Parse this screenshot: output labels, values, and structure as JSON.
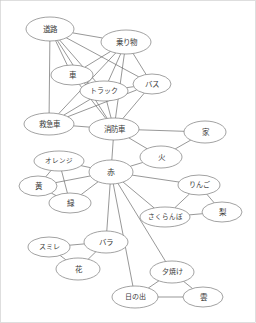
{
  "graph": {
    "title": "",
    "width": 256,
    "height": 323,
    "style": {
      "node_fill": "#ffffff",
      "node_stroke": "#7a7a7a",
      "edge_stroke": "#6b6b6b",
      "label_color": "#3a3a3a",
      "border_color": "#c8c8c8",
      "background": "#ffffff"
    },
    "nodes": [
      {
        "id": "road",
        "label": "道路",
        "x": 50,
        "y": 29,
        "rx": 24,
        "ry": 12,
        "font_size": 7.5
      },
      {
        "id": "vehicle",
        "label": "乗り物",
        "x": 126,
        "y": 42,
        "rx": 25,
        "ry": 12,
        "font_size": 7.5
      },
      {
        "id": "car",
        "label": "車",
        "x": 72,
        "y": 75,
        "rx": 21,
        "ry": 10,
        "font_size": 7.5
      },
      {
        "id": "truck",
        "label": "トラック",
        "x": 104,
        "y": 91,
        "rx": 24,
        "ry": 10,
        "font_size": 7
      },
      {
        "id": "bus",
        "label": "バス",
        "x": 152,
        "y": 84,
        "rx": 19,
        "ry": 10,
        "font_size": 7.5
      },
      {
        "id": "ambulance",
        "label": "救急車",
        "x": 49,
        "y": 124,
        "rx": 25,
        "ry": 11,
        "font_size": 7.5
      },
      {
        "id": "firetruck",
        "label": "消防車",
        "x": 114,
        "y": 129,
        "rx": 25,
        "ry": 11,
        "font_size": 7.5
      },
      {
        "id": "house",
        "label": "家",
        "x": 205,
        "y": 132,
        "rx": 21,
        "ry": 11,
        "font_size": 7.5
      },
      {
        "id": "fire",
        "label": "火",
        "x": 161,
        "y": 157,
        "rx": 21,
        "ry": 11,
        "font_size": 7.5
      },
      {
        "id": "orange",
        "label": "オレンジ",
        "x": 59,
        "y": 161,
        "rx": 25,
        "ry": 10,
        "font_size": 6.5
      },
      {
        "id": "red",
        "label": "赤",
        "x": 111,
        "y": 172,
        "rx": 22,
        "ry": 12,
        "font_size": 8
      },
      {
        "id": "yellow",
        "label": "黄",
        "x": 38,
        "y": 186,
        "rx": 19,
        "ry": 10,
        "font_size": 7.5
      },
      {
        "id": "green",
        "label": "緑",
        "x": 70,
        "y": 203,
        "rx": 21,
        "ry": 10,
        "font_size": 7.5
      },
      {
        "id": "apple",
        "label": "りんご",
        "x": 199,
        "y": 185,
        "rx": 21,
        "ry": 10,
        "font_size": 7
      },
      {
        "id": "pear",
        "label": "梨",
        "x": 222,
        "y": 212,
        "rx": 20,
        "ry": 10,
        "font_size": 7.5
      },
      {
        "id": "cherry",
        "label": "さくらんぼ",
        "x": 165,
        "y": 217,
        "rx": 25,
        "ry": 10,
        "font_size": 6.5
      },
      {
        "id": "violet",
        "label": "スミレ",
        "x": 49,
        "y": 247,
        "rx": 21,
        "ry": 10,
        "font_size": 7
      },
      {
        "id": "rose",
        "label": "バラ",
        "x": 106,
        "y": 242,
        "rx": 22,
        "ry": 11,
        "font_size": 7.5
      },
      {
        "id": "flower",
        "label": "花",
        "x": 78,
        "y": 269,
        "rx": 22,
        "ry": 11,
        "font_size": 7.5
      },
      {
        "id": "sunset",
        "label": "夕焼け",
        "x": 172,
        "y": 272,
        "rx": 22,
        "ry": 11,
        "font_size": 7
      },
      {
        "id": "sunrise",
        "label": "日の出",
        "x": 135,
        "y": 297,
        "rx": 23,
        "ry": 11,
        "font_size": 7
      },
      {
        "id": "cloud",
        "label": "雲",
        "x": 203,
        "y": 297,
        "rx": 20,
        "ry": 10,
        "font_size": 7.5
      }
    ],
    "edges": [
      {
        "source": "road",
        "target": "vehicle"
      },
      {
        "source": "road",
        "target": "car"
      },
      {
        "source": "road",
        "target": "truck"
      },
      {
        "source": "road",
        "target": "bus"
      },
      {
        "source": "road",
        "target": "ambulance"
      },
      {
        "source": "road",
        "target": "firetruck"
      },
      {
        "source": "vehicle",
        "target": "car"
      },
      {
        "source": "vehicle",
        "target": "truck"
      },
      {
        "source": "vehicle",
        "target": "bus"
      },
      {
        "source": "vehicle",
        "target": "ambulance"
      },
      {
        "source": "vehicle",
        "target": "firetruck"
      },
      {
        "source": "car",
        "target": "truck"
      },
      {
        "source": "car",
        "target": "firetruck"
      },
      {
        "source": "truck",
        "target": "bus"
      },
      {
        "source": "truck",
        "target": "ambulance"
      },
      {
        "source": "truck",
        "target": "firetruck"
      },
      {
        "source": "bus",
        "target": "ambulance"
      },
      {
        "source": "bus",
        "target": "firetruck"
      },
      {
        "source": "ambulance",
        "target": "firetruck"
      },
      {
        "source": "firetruck",
        "target": "house"
      },
      {
        "source": "firetruck",
        "target": "fire"
      },
      {
        "source": "firetruck",
        "target": "red"
      },
      {
        "source": "house",
        "target": "fire"
      },
      {
        "source": "fire",
        "target": "red"
      },
      {
        "source": "red",
        "target": "orange"
      },
      {
        "source": "red",
        "target": "yellow"
      },
      {
        "source": "red",
        "target": "green"
      },
      {
        "source": "red",
        "target": "apple"
      },
      {
        "source": "red",
        "target": "cherry"
      },
      {
        "source": "red",
        "target": "rose"
      },
      {
        "source": "red",
        "target": "sunset"
      },
      {
        "source": "red",
        "target": "sunrise"
      },
      {
        "source": "orange",
        "target": "yellow"
      },
      {
        "source": "orange",
        "target": "green"
      },
      {
        "source": "yellow",
        "target": "green"
      },
      {
        "source": "apple",
        "target": "cherry"
      },
      {
        "source": "apple",
        "target": "pear"
      },
      {
        "source": "cherry",
        "target": "pear"
      },
      {
        "source": "violet",
        "target": "rose"
      },
      {
        "source": "violet",
        "target": "flower"
      },
      {
        "source": "rose",
        "target": "flower"
      },
      {
        "source": "sunset",
        "target": "sunrise"
      },
      {
        "source": "sunset",
        "target": "cloud"
      },
      {
        "source": "sunrise",
        "target": "cloud"
      }
    ]
  }
}
